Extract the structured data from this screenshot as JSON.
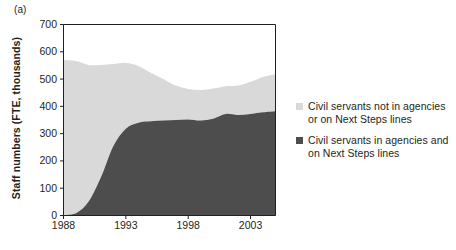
{
  "figure": {
    "panel_label": "(a)"
  },
  "chart_data": {
    "type": "area",
    "title": "",
    "xlabel": "",
    "ylabel": "Staff numbers (FTE, thousands)",
    "xlim": [
      1988,
      2005
    ],
    "ylim": [
      0,
      700
    ],
    "grid": false,
    "stacked": true,
    "legend_position": "right",
    "x": [
      1988,
      1989,
      1990,
      1991,
      1992,
      1993,
      1994,
      1995,
      1996,
      1997,
      1998,
      1999,
      2000,
      2001,
      2002,
      2003,
      2004,
      2005
    ],
    "xticks": [
      1988,
      1993,
      1998,
      2003
    ],
    "xtick_labels": [
      "1988",
      "1993",
      "1998",
      "2003"
    ],
    "yticks": [
      0,
      100,
      200,
      300,
      400,
      500,
      600,
      700
    ],
    "ytick_labels": [
      "0",
      "100",
      "200",
      "300",
      "400",
      "500",
      "600",
      "700"
    ],
    "series": [
      {
        "name": "Civil servants in agencies and on Next Steps lines",
        "color": "#4d4d4d",
        "order": "bottom",
        "values": [
          2,
          8,
          50,
          140,
          255,
          318,
          340,
          345,
          348,
          350,
          352,
          348,
          355,
          372,
          368,
          372,
          378,
          382
        ]
      },
      {
        "name": "Civil servants not in agencies or on Next Steps lines",
        "color": "#d9d9d9",
        "order": "top",
        "values": [
          568,
          558,
          502,
          412,
          300,
          242,
          208,
          178,
          152,
          126,
          112,
          112,
          110,
          102,
          108,
          118,
          130,
          136
        ]
      }
    ],
    "totals": [
      570,
      566,
      552,
      552,
      555,
      560,
      548,
      523,
      500,
      476,
      464,
      460,
      465,
      474,
      476,
      490,
      508,
      518
    ]
  },
  "legend": {
    "entries": [
      {
        "label": "Civil servants not in agencies or on Next Steps lines",
        "color": "#d9d9d9"
      },
      {
        "label": "Civil servants in agencies and on Next Steps lines",
        "color": "#4d4d4d"
      }
    ]
  },
  "axes": {
    "line_color": "#231f20"
  }
}
